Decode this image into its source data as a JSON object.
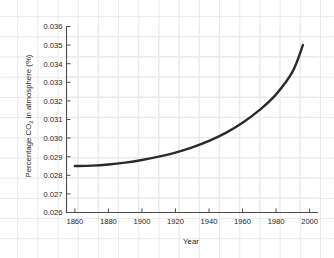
{
  "chart_data": {
    "type": "line",
    "title": "",
    "xlabel": "Year",
    "ylabel": "Percentage CO2 in atmosphere (%)",
    "ylabel_parts": {
      "before": "Percentage CO",
      "subscript": "2",
      "after": " in atmosphere (%)"
    },
    "xlim": [
      1855,
      2005
    ],
    "ylim": [
      0.026,
      0.036
    ],
    "xticks": [
      1860,
      1880,
      1900,
      1920,
      1940,
      1960,
      1980,
      2000
    ],
    "xtick_labels": [
      "1860",
      "1880",
      "1900",
      "1920",
      "1940",
      "1960",
      "1980",
      "2000"
    ],
    "yticks": [
      0.026,
      0.027,
      0.028,
      0.029,
      0.03,
      0.031,
      0.032,
      0.033,
      0.034,
      0.035,
      0.036
    ],
    "ytick_labels": [
      "0.026",
      "0.027",
      "0.028",
      "0.029",
      "0.030",
      "0.031",
      "0.032",
      "0.033",
      "0.034",
      "0.035",
      "0.036"
    ],
    "grid": true,
    "legend": null,
    "series": [
      {
        "name": "CO2 concentration",
        "color": "#2b2b2d",
        "x": [
          1860,
          1870,
          1880,
          1890,
          1900,
          1910,
          1920,
          1930,
          1940,
          1950,
          1960,
          1970,
          1980,
          1990,
          1996
        ],
        "y": [
          0.0285,
          0.02852,
          0.02858,
          0.02868,
          0.02882,
          0.029,
          0.02922,
          0.0295,
          0.02985,
          0.03028,
          0.03082,
          0.0315,
          0.03235,
          0.0336,
          0.035
        ]
      }
    ],
    "annotations": []
  },
  "axes": {
    "x_axis_name": "x-axis",
    "y_axis_name": "y-axis"
  }
}
